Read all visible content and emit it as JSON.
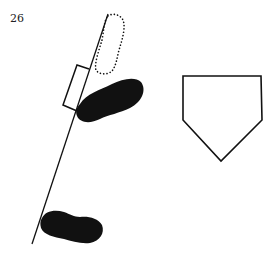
{
  "page": {
    "number": "26"
  },
  "diagram": {
    "elements": [
      {
        "name": "box-line",
        "type": "line"
      },
      {
        "name": "dotted-foot-outline",
        "type": "dotted-footprint"
      },
      {
        "name": "bracket-outline",
        "type": "outline"
      },
      {
        "name": "front-foot",
        "type": "filled-footprint"
      },
      {
        "name": "back-foot",
        "type": "filled-footprint"
      },
      {
        "name": "home-plate",
        "type": "pentagon"
      }
    ],
    "colors": {
      "ink": "#111111",
      "background": "#ffffff"
    }
  }
}
